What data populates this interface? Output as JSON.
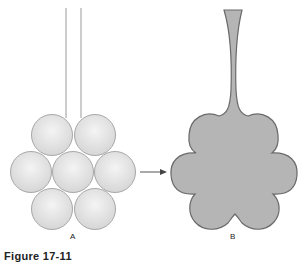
{
  "figure": {
    "caption": "Figure 17-11",
    "panels": [
      {
        "id": "A",
        "label": "A",
        "description": "Seven spheres in hexagonal packing with two parallel wires/lines above"
      },
      {
        "id": "B",
        "label": "B",
        "description": "Fused six-lobed shape with narrow neck drawn upward"
      }
    ],
    "arrow": {
      "from": "A",
      "to": "B"
    },
    "colors": {
      "sphere_fill": "#e4e4e4",
      "sphere_stroke": "#a8a8a8",
      "blob_fill": "#b5b5b5",
      "blob_stroke": "#6a6a6a",
      "line": "#9a9a9a",
      "arrow": "#555555"
    }
  }
}
